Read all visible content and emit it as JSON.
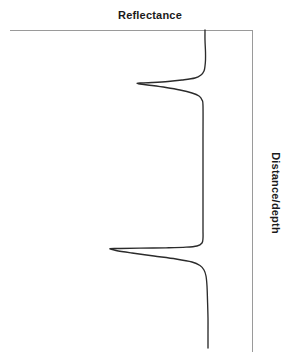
{
  "figure": {
    "top_axis_label": "Reflectance",
    "right_axis_label": "Distance/depth",
    "axis_color": "#9a9a9a",
    "trace_color": "#2b2b2b",
    "background_color": "#ffffff"
  },
  "chart_data": {
    "type": "line",
    "title": "",
    "xlabel": "Reflectance",
    "ylabel": "Distance/depth",
    "orientation": "vertical-depth",
    "grid": false,
    "legend": null,
    "axes": {
      "x_axis_position": "top",
      "x_axis_label": "Reflectance",
      "x_axis_direction": "increasing-leftward",
      "x_ticks": [],
      "y_axis_position": "right",
      "y_axis_label": "Distance/depth",
      "y_axis_direction": "increasing-downward",
      "y_ticks": [],
      "x_pixel_range": [
        10,
        252
      ],
      "y_pixel_range": [
        30,
        352
      ]
    },
    "baseline_x": 203,
    "series": [
      {
        "name": "reflectance",
        "points": [
          [
            205,
            30
          ],
          [
            205,
            40
          ],
          [
            205.5,
            52
          ],
          [
            205.5,
            60
          ],
          [
            205,
            66
          ],
          [
            204,
            71
          ],
          [
            201,
            75
          ],
          [
            195,
            78
          ],
          [
            182,
            80
          ],
          [
            168,
            81.5
          ],
          [
            152,
            82.5
          ],
          [
            140,
            83
          ],
          [
            137,
            83.2
          ],
          [
            140,
            84
          ],
          [
            152,
            85.5
          ],
          [
            166,
            87.5
          ],
          [
            180,
            90
          ],
          [
            192,
            93
          ],
          [
            199,
            96
          ],
          [
            202,
            100
          ],
          [
            203,
            106
          ],
          [
            203,
            140
          ],
          [
            203,
            180
          ],
          [
            203,
            215
          ],
          [
            203,
            230
          ],
          [
            203,
            238
          ],
          [
            202,
            243
          ],
          [
            197,
            246
          ],
          [
            186,
            247.2
          ],
          [
            166,
            247.8
          ],
          [
            140,
            248.2
          ],
          [
            120,
            248.5
          ],
          [
            110,
            248.7
          ],
          [
            116,
            250.5
          ],
          [
            132,
            253
          ],
          [
            154,
            256
          ],
          [
            176,
            259
          ],
          [
            192,
            262
          ],
          [
            200,
            265.5
          ],
          [
            204,
            270
          ],
          [
            206,
            276
          ],
          [
            207,
            286
          ],
          [
            207.5,
            300
          ],
          [
            208,
            318
          ],
          [
            208,
            334
          ],
          [
            208,
            348
          ]
        ],
        "peaks": [
          {
            "name": "upper-reflection",
            "depth_px": 83,
            "amplitude_px": 66
          },
          {
            "name": "lower-reflection",
            "depth_px": 248,
            "amplitude_px": 93
          }
        ]
      }
    ]
  }
}
